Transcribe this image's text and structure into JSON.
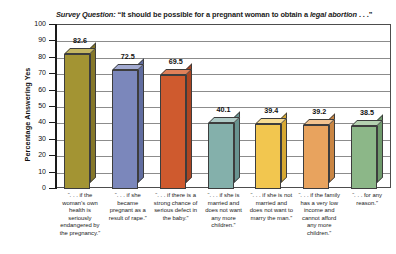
{
  "chart_data": {
    "type": "bar",
    "title_parts": {
      "lead_italic": "Survey Question:",
      "quote_open": " “It should be possible for a pregnant woman to obtain a ",
      "emphasis": "legal abortion",
      "quote_close": " . . .”"
    },
    "xlabel": "",
    "ylabel": "Percentage Answering Yes",
    "ylim": [
      0,
      100
    ],
    "ytick_step": 10,
    "yticks": [
      0,
      10,
      20,
      30,
      40,
      50,
      60,
      70,
      80,
      90,
      100
    ],
    "grid": true,
    "legend": "none",
    "categories": [
      "“. . . if the woman’s own health is seriously endangered by the pregnancy.”",
      "“. . . if she became pregnant as a result of rape.”",
      "“. . . if there is a strong chance of serious defect in the baby.”",
      "“. . . if she is married and does not want any more children.”",
      "“. . . if she is not married and does not want to marry the man.”",
      "“. . . if the family has a very low income and cannot afford any more children.”",
      "“. . . for any reason.”"
    ],
    "values": [
      82.6,
      72.5,
      69.5,
      40.1,
      39.4,
      39.2,
      38.5
    ],
    "value_labels": [
      "82.6",
      "72.5",
      "69.5",
      "40.1",
      "39.4",
      "39.2",
      "38.5"
    ],
    "bar_colors": [
      "#a39433",
      "#7b87bb",
      "#cf5a2e",
      "#84b0ab",
      "#f2c64f",
      "#e8a35e",
      "#8cb788"
    ],
    "bar_colors_top": [
      "#c4b662",
      "#a3abd2",
      "#e08059",
      "#aecac6",
      "#f7dc92",
      "#f2c390",
      "#b4d1b0"
    ],
    "bar_colors_side": [
      "#857729",
      "#616da0",
      "#ab4522",
      "#699491",
      "#d6a833",
      "#c98543",
      "#6f9a6c"
    ]
  },
  "ylabels": [
    "100",
    "90",
    "80",
    "70",
    "60",
    "50",
    "40",
    "30",
    "20",
    "10",
    "0"
  ]
}
